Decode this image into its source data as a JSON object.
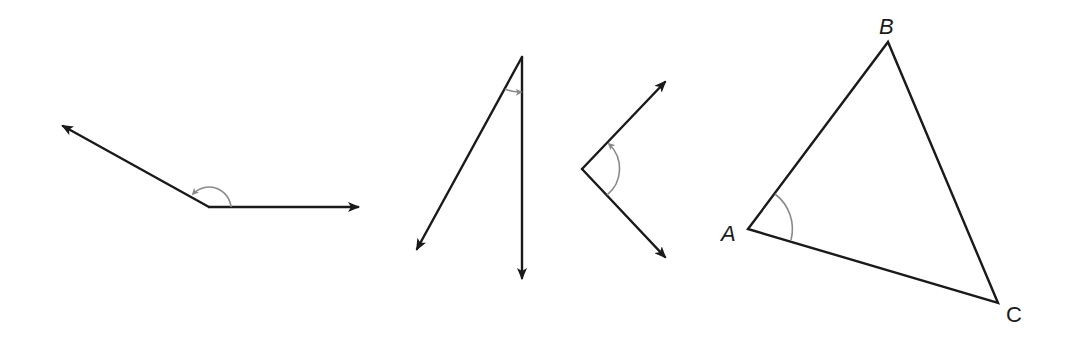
{
  "figure": {
    "colors": {
      "line": "#1a1a1a",
      "arc": "#8a8a8a",
      "background": "#ffffff"
    },
    "angles": [
      {
        "id": "angle-obtuse",
        "vertex": [
          209,
          207
        ],
        "ray_ends": [
          [
            61,
            125
          ],
          [
            360,
            207
          ]
        ]
      },
      {
        "id": "angle-acute-narrow",
        "vertex": [
          522,
          57
        ],
        "ray_ends": [
          [
            416,
            251
          ],
          [
            522,
            280
          ]
        ]
      },
      {
        "id": "angle-right-ish",
        "vertex": [
          582,
          169
        ],
        "ray_ends": [
          [
            667,
            80
          ],
          [
            667,
            259
          ]
        ]
      }
    ],
    "triangle": {
      "vertices": {
        "A": [
          748,
          229
        ],
        "B": [
          888,
          42
        ],
        "C": [
          998,
          303
        ]
      },
      "labels": {
        "A": "A",
        "B": "B",
        "C": "C"
      },
      "marked_angle": "A"
    }
  }
}
